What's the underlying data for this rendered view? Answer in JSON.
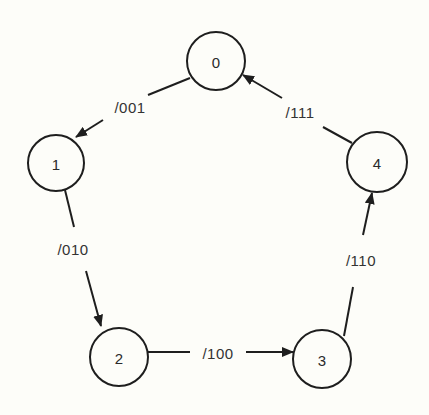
{
  "diagram": {
    "type": "state-transition",
    "background": "#fdfdf9",
    "stroke_color": "#1e1e1e",
    "states": [
      {
        "id": "0",
        "label": "0",
        "cx": 216,
        "cy": 61,
        "r": 29
      },
      {
        "id": "1",
        "label": "1",
        "cx": 56,
        "cy": 163,
        "r": 28
      },
      {
        "id": "2",
        "label": "2",
        "cx": 119,
        "cy": 357,
        "r": 29
      },
      {
        "id": "3",
        "label": "3",
        "cx": 322,
        "cy": 359,
        "r": 29
      },
      {
        "id": "4",
        "label": "4",
        "cx": 377,
        "cy": 162,
        "r": 30
      }
    ],
    "transitions": [
      {
        "from": "0",
        "to": "1",
        "label": "/001",
        "label_x": 130,
        "label_y": 107
      },
      {
        "from": "1",
        "to": "2",
        "label": "/010",
        "label_x": 73,
        "label_y": 249
      },
      {
        "from": "2",
        "to": "3",
        "label": "/100",
        "label_x": 218,
        "label_y": 353
      },
      {
        "from": "3",
        "to": "4",
        "label": "/110",
        "label_x": 361,
        "label_y": 260
      },
      {
        "from": "4",
        "to": "0",
        "label": "/111",
        "label_x": 300,
        "label_y": 112
      }
    ]
  }
}
